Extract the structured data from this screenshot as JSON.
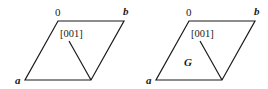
{
  "figures": [
    {
      "id": "left",
      "origin_label": "0",
      "b_label": "b",
      "a_label": "a",
      "direction_label": "[001]",
      "region_label": ""
    },
    {
      "id": "right",
      "origin_label": "0",
      "b_label": "b",
      "a_label": "a",
      "direction_label": "[001]",
      "region_label": "G"
    }
  ],
  "colors": {
    "stroke": "#1a1a1a",
    "background": "#ffffff"
  }
}
